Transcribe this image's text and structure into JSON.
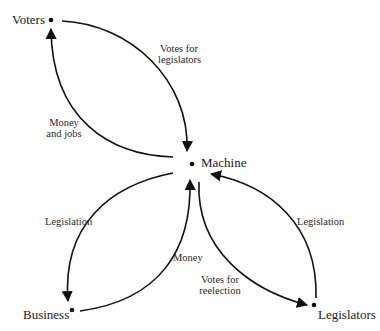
{
  "diagram": {
    "type": "flow-diagram",
    "colors": {
      "line": "#111111",
      "text": "#1a1a1a",
      "background": "#ffffff"
    },
    "nodes": {
      "voters": {
        "label": "Voters"
      },
      "machine": {
        "label": "Machine"
      },
      "business": {
        "label": "Business"
      },
      "legislators": {
        "label": "Legislators"
      }
    },
    "edges": {
      "votes_for_legislators": {
        "from": "Voters",
        "to": "Machine",
        "line1": "Votes for",
        "line2": "legislators"
      },
      "money_and_jobs": {
        "from": "Machine",
        "to": "Voters",
        "line1": "Money",
        "line2": "and jobs"
      },
      "legislation_to_business": {
        "from": "Machine",
        "to": "Business",
        "line1": "Legislation"
      },
      "money": {
        "from": "Business",
        "to": "Machine",
        "line1": "Money"
      },
      "votes_for_reelection": {
        "from": "Machine",
        "to": "Legislators",
        "line1": "Votes for",
        "line2": "reelection"
      },
      "legislation_from_legislators": {
        "from": "Legislators",
        "to": "Machine",
        "line1": "Legislation"
      }
    }
  }
}
